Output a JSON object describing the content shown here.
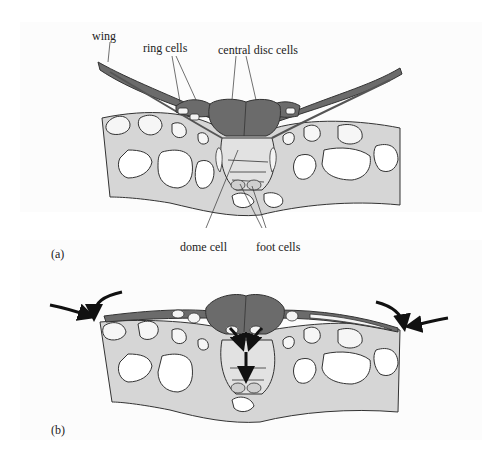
{
  "figure": {
    "panel_a": {
      "label": "(a)",
      "annotations": {
        "wing": "wing",
        "ring_cells": "ring cells",
        "central_disc_cells": "central disc cells",
        "dome_cell": "dome cell",
        "foot_cells": "foot cells"
      }
    },
    "panel_b": {
      "label": "(b)"
    },
    "colors": {
      "dark_cells": "#6b6b6b",
      "tissue_fill": "#d9d9d9",
      "cell_lumen": "#f4f4f4",
      "outline": "#333333",
      "arrow": "#111111"
    }
  }
}
